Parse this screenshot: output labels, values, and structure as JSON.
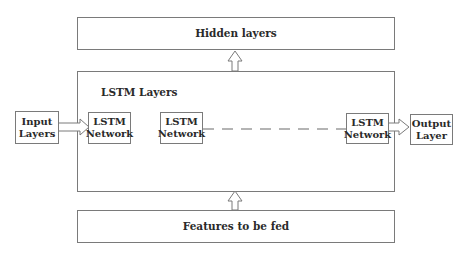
{
  "diagram": {
    "hidden": {
      "label": "Hidden layers"
    },
    "lstm_group": {
      "label": "LSTM Layers"
    },
    "features": {
      "label": "Features to be fed"
    },
    "input": {
      "line1": "Input",
      "line2": "Layers"
    },
    "output": {
      "line1": "Output",
      "line2": "Layer"
    },
    "lstm_nodes": [
      {
        "line1": "LSTM",
        "line2": "Network"
      },
      {
        "line1": "LSTM",
        "line2": "Network"
      },
      {
        "line1": "LSTM",
        "line2": "Network"
      }
    ],
    "edges": [
      {
        "from": "Features to be fed",
        "to": "LSTM Layers",
        "style": "hollow-arrow"
      },
      {
        "from": "LSTM Layers",
        "to": "Hidden layers",
        "style": "hollow-arrow"
      },
      {
        "from": "Input Layers",
        "to": "LSTM Network 1",
        "style": "hollow-arrow"
      },
      {
        "from": "LSTM Network 2",
        "to": "LSTM Network 3",
        "style": "dashed"
      },
      {
        "from": "LSTM Network 3",
        "to": "Output Layer",
        "style": "hollow-arrow"
      }
    ]
  }
}
